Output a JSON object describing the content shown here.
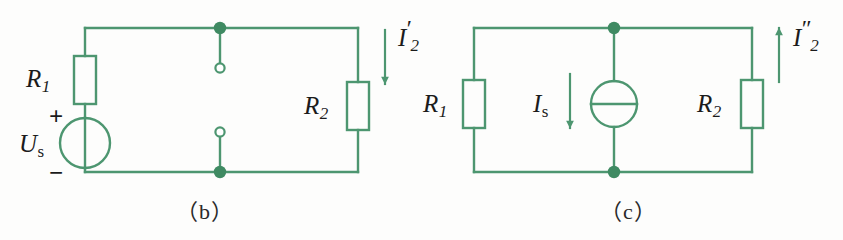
{
  "figure": {
    "background_color": "#fdfdfc",
    "line_color": "#4d9670",
    "text_color": "#1b1b1b",
    "caption_color": "#2a2a2a",
    "panels": [
      {
        "id": "panel-b",
        "caption": "（b）",
        "description": "Voltage source circuit with open terminals",
        "components": {
          "resistor_1_label": "R",
          "resistor_1_sub": "1",
          "resistor_2_label": "R",
          "resistor_2_sub": "2",
          "source_label": "U",
          "source_sub": "s",
          "polarity_plus": "+",
          "polarity_minus": "−",
          "current_label": "I",
          "current_sub": "2",
          "current_prime": "′",
          "current_direction": "down"
        }
      },
      {
        "id": "panel-c",
        "caption": "（c）",
        "description": "Current source circuit",
        "components": {
          "resistor_1_label": "R",
          "resistor_1_sub": "1",
          "resistor_2_label": "R",
          "resistor_2_sub": "2",
          "source_label": "I",
          "source_sub": "s",
          "source_current_direction": "down",
          "current_label": "I",
          "current_sub": "2",
          "current_prime": "″",
          "current_direction": "up"
        }
      }
    ]
  }
}
